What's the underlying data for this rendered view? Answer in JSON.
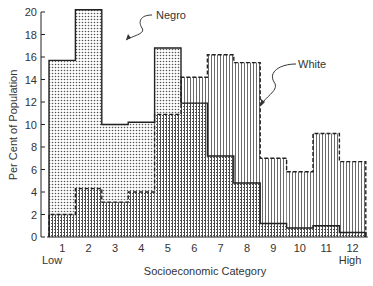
{
  "chart_data": {
    "type": "bar",
    "title": "",
    "xlabel": "Socioeconomic Category",
    "ylabel": "Per Cent of Population",
    "ylim": [
      0,
      20
    ],
    "yticks": [
      0,
      2,
      4,
      6,
      8,
      10,
      12,
      14,
      16,
      18,
      20
    ],
    "categories": [
      "1",
      "2",
      "3",
      "4",
      "5",
      "6",
      "7",
      "8",
      "9",
      "10",
      "11",
      "12"
    ],
    "x_end_labels": {
      "low": "Low",
      "high": "High"
    },
    "grid": false,
    "legend_position": "annotations",
    "series": [
      {
        "name": "Negro",
        "values": [
          15.7,
          20.2,
          10.0,
          10.2,
          16.8,
          11.9,
          7.2,
          4.8,
          1.2,
          0.8,
          1.0,
          0.4
        ]
      },
      {
        "name": "White",
        "values": [
          2.0,
          4.3,
          3.1,
          4.0,
          10.9,
          14.2,
          16.2,
          15.5,
          7.0,
          5.8,
          9.2,
          6.7
        ]
      }
    ],
    "annotations": [
      {
        "text": "Negro",
        "series": "Negro"
      },
      {
        "text": "White",
        "series": "White"
      }
    ]
  }
}
